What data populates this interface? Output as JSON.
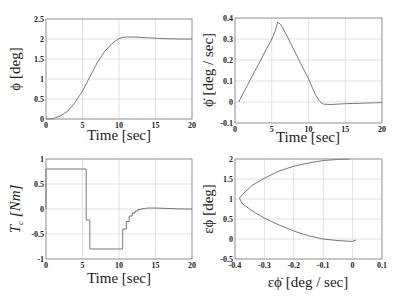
{
  "chart_data": [
    {
      "id": "phi",
      "type": "line",
      "title": "",
      "xlabel": "Time [sec]",
      "ylabel": "ϕ [deg]",
      "xlim": [
        0,
        20
      ],
      "ylim": [
        0,
        2.5
      ],
      "xticks": [
        0,
        5,
        10,
        15,
        20
      ],
      "yticks": [
        0,
        0.5,
        1,
        1.5,
        2,
        2.5
      ],
      "xtick_labels": [
        "0",
        "5",
        "10",
        "15",
        "20"
      ],
      "ytick_labels": [
        "0",
        "0.5",
        "1",
        "1.5",
        "2",
        "2.5"
      ],
      "grid": true,
      "box": {
        "x0": 46,
        "y0": 19,
        "x1": 192,
        "y1": 119
      },
      "series": [
        {
          "name": "phi",
          "x": [
            0,
            1,
            2,
            3,
            4,
            5,
            6,
            7,
            8,
            9,
            10,
            10.5,
            11,
            12,
            13,
            14,
            15,
            16,
            17,
            18,
            19,
            20
          ],
          "y": [
            0,
            0.01,
            0.08,
            0.2,
            0.42,
            0.7,
            1.05,
            1.4,
            1.68,
            1.88,
            2.01,
            2.04,
            2.05,
            2.05,
            2.04,
            2.03,
            2.02,
            2.01,
            2.005,
            2.0,
            2.0,
            2.0
          ]
        }
      ]
    },
    {
      "id": "phidot",
      "type": "line",
      "title": "",
      "xlabel": "Time [sec]",
      "ylabel": "ϕ̇ [deg / sec]",
      "xlim": [
        0,
        20
      ],
      "ylim": [
        -0.1,
        0.4
      ],
      "xticks": [
        0,
        5,
        10,
        15,
        20
      ],
      "yticks": [
        -0.1,
        0,
        0.1,
        0.2,
        0.3,
        0.4
      ],
      "xtick_labels": [
        "0",
        "5",
        "10",
        "15",
        "20"
      ],
      "ytick_labels": [
        "-0.1",
        "0",
        "0.1",
        "0.2",
        "0.3",
        "0.4"
      ],
      "grid": true,
      "box": {
        "x0": 235,
        "y0": 18,
        "x1": 382,
        "y1": 123
      },
      "series": [
        {
          "name": "phi_dot",
          "x": [
            0.5,
            1,
            2,
            3,
            4,
            5,
            5.5,
            5.8,
            6.2,
            7,
            8,
            9,
            10,
            10.5,
            11,
            11.5,
            12,
            13,
            14,
            15,
            16,
            17,
            18,
            19,
            20
          ],
          "y": [
            0,
            0.034,
            0.1,
            0.167,
            0.234,
            0.3,
            0.34,
            0.38,
            0.37,
            0.32,
            0.25,
            0.18,
            0.11,
            0.07,
            0.03,
            0.005,
            -0.01,
            -0.012,
            -0.01,
            -0.008,
            -0.007,
            -0.006,
            -0.005,
            -0.004,
            -0.003
          ]
        }
      ]
    },
    {
      "id": "torque",
      "type": "line",
      "title": "",
      "xlabel": "Time [sec]",
      "ylabel": "T_c [Nm]",
      "ylabel_main": "T",
      "ylabel_sub": "c",
      "ylabel_unit": " [Nm]",
      "xlim": [
        0,
        20
      ],
      "ylim": [
        -1,
        1
      ],
      "xticks": [
        0,
        5,
        10,
        15,
        20
      ],
      "yticks": [
        -1,
        -0.5,
        0,
        0.5,
        1
      ],
      "xtick_labels": [
        "0",
        "5",
        "10",
        "15",
        "20"
      ],
      "ytick_labels": [
        "-1",
        "-0.5",
        "0",
        "0.5",
        "1"
      ],
      "grid": true,
      "box": {
        "x0": 46,
        "y0": 159,
        "x1": 192,
        "y1": 259
      },
      "series": [
        {
          "name": "Tc",
          "x": [
            0,
            0,
            5.5,
            5.5,
            6,
            6,
            10.5,
            10.5,
            11,
            11,
            11.4,
            11.4,
            11.8,
            11.8,
            12.2,
            12.2,
            12.6,
            12.6,
            13,
            13,
            13.5,
            14,
            15,
            16,
            17,
            18,
            19,
            20
          ],
          "y": [
            0,
            0.8,
            0.8,
            -0.22,
            -0.22,
            -0.8,
            -0.8,
            -0.4,
            -0.4,
            -0.25,
            -0.25,
            -0.14,
            -0.14,
            -0.08,
            -0.08,
            -0.04,
            -0.04,
            -0.01,
            -0.01,
            0.0,
            0.01,
            0.02,
            0.02,
            0.015,
            0.01,
            0.005,
            0.0,
            0.0
          ]
        }
      ]
    },
    {
      "id": "phase",
      "type": "line",
      "title": "",
      "xlabel": "εϕ̇ [deg / sec]",
      "ylabel": "εϕ [deg]",
      "xlim": [
        -0.4,
        0.1
      ],
      "ylim": [
        -0.5,
        2
      ],
      "xticks": [
        -0.4,
        -0.3,
        -0.2,
        -0.1,
        0,
        0.1
      ],
      "yticks": [
        -0.5,
        0,
        0.5,
        1,
        1.5,
        2
      ],
      "xtick_labels": [
        "-0.4",
        "-0.3",
        "-0.2",
        "-0.1",
        "0",
        "0.1"
      ],
      "ytick_labels": [
        "-0.5",
        "0",
        "0.5",
        "1",
        "1.5",
        "2"
      ],
      "grid": true,
      "box": {
        "x0": 235,
        "y0": 159,
        "x1": 382,
        "y1": 259
      },
      "series": [
        {
          "name": "phase_trajectory",
          "x": [
            -0.01,
            -0.05,
            -0.1,
            -0.15,
            -0.2,
            -0.25,
            -0.3,
            -0.34,
            -0.37,
            -0.385,
            -0.38,
            -0.375,
            -0.36,
            -0.33,
            -0.3,
            -0.25,
            -0.2,
            -0.15,
            -0.1,
            -0.05,
            0.0,
            0.01,
            0.005
          ],
          "y": [
            2.0,
            1.99,
            1.96,
            1.9,
            1.82,
            1.7,
            1.52,
            1.35,
            1.15,
            1.02,
            0.95,
            0.88,
            0.8,
            0.65,
            0.52,
            0.35,
            0.2,
            0.08,
            0.0,
            -0.04,
            -0.06,
            -0.03,
            -0.05
          ]
        }
      ]
    }
  ]
}
